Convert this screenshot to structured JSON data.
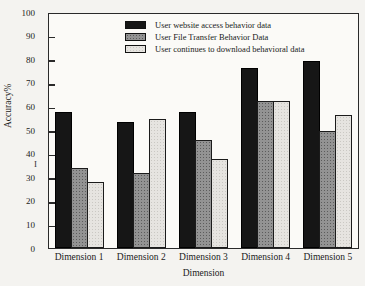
{
  "figure": {
    "y_axis": {
      "stray_mark": "I"
    }
  },
  "chart_data": {
    "type": "bar",
    "title": "",
    "xlabel": "Dimension",
    "ylabel": "Accuracy%",
    "ylim": [
      0,
      100
    ],
    "yticks": [
      0,
      10,
      20,
      30,
      40,
      50,
      60,
      70,
      80,
      90,
      100
    ],
    "grid": false,
    "legend_position": "top-right-inside",
    "categories": [
      "Dimension 1",
      "Dimension 2",
      "Dimension 3",
      "Dimension 4",
      "Dimension 5"
    ],
    "series": [
      {
        "name": "User website access behavior data",
        "color": "#161616",
        "pattern": "solid",
        "values": [
          58,
          54,
          58,
          77,
          80
        ]
      },
      {
        "name": "User File Transfer Behavior Data",
        "color": "#939393",
        "pattern": "dots-dark",
        "values": [
          34,
          32,
          46,
          63,
          50
        ]
      },
      {
        "name": "User continues to download behavioral data",
        "color": "#e6e4e0",
        "pattern": "dots-light",
        "values": [
          28,
          55,
          38,
          63,
          57
        ]
      }
    ]
  }
}
